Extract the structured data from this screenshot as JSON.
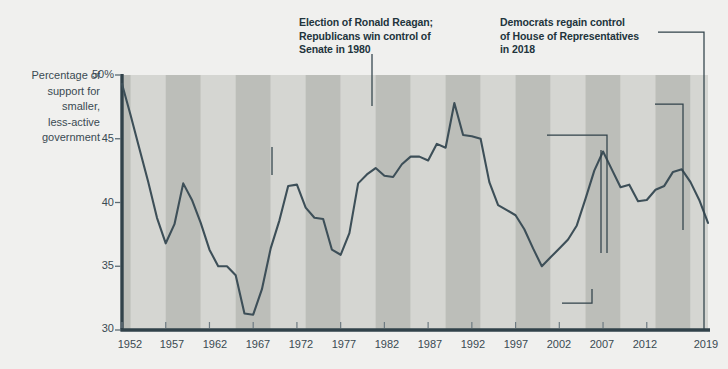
{
  "chart_data": {
    "type": "line",
    "title": "",
    "xlabel": "",
    "ylabel": "Percentage of support for smaller, less-active government",
    "ylim": [
      30,
      50
    ],
    "xlim": [
      1952,
      2019
    ],
    "grid": false,
    "legend": "none",
    "y_ticks": [
      "50%",
      "45",
      "40",
      "35",
      "30"
    ],
    "y_tick_values": [
      50,
      45,
      40,
      35,
      30
    ],
    "x_ticks": [
      "1952",
      "1957",
      "1962",
      "1967",
      "1972",
      "1977",
      "1982",
      "1987",
      "1992",
      "1997",
      "2002",
      "2007",
      "2012",
      "2019"
    ],
    "x_tick_values": [
      1952,
      1957,
      1962,
      1967,
      1972,
      1977,
      1982,
      1987,
      1992,
      1997,
      2002,
      2007,
      2012,
      2019
    ],
    "line_color": "#3d4f58",
    "band_color_light": "#d5d6d2",
    "band_color_dark": "#bcbeb9",
    "series": [
      {
        "name": "Percentage of support for smaller, less-active government",
        "x": [
          1952,
          1953,
          1954,
          1955,
          1956,
          1957,
          1958,
          1959,
          1960,
          1961,
          1962,
          1963,
          1964,
          1965,
          1966,
          1967,
          1968,
          1969,
          1970,
          1971,
          1972,
          1973,
          1974,
          1975,
          1976,
          1977,
          1978,
          1979,
          1980,
          1981,
          1982,
          1983,
          1984,
          1985,
          1986,
          1987,
          1988,
          1989,
          1990,
          1991,
          1992,
          1993,
          1994,
          1995,
          1996,
          1997,
          1998,
          1999,
          2000,
          2001,
          2002,
          2003,
          2004,
          2005,
          2006,
          2007,
          2008,
          2009,
          2010,
          2011,
          2012,
          2013,
          2014,
          2015,
          2016,
          2017,
          2018,
          2019
        ],
        "values": [
          49.3,
          46.8,
          44.2,
          41.6,
          38.8,
          36.8,
          38.3,
          41.5,
          40.2,
          38.4,
          36.3,
          35.0,
          35.0,
          34.3,
          31.3,
          31.2,
          33.2,
          36.4,
          38.6,
          41.3,
          41.4,
          39.6,
          38.8,
          38.7,
          36.3,
          35.9,
          37.6,
          41.5,
          42.2,
          42.7,
          42.1,
          42.0,
          43.0,
          43.6,
          43.6,
          43.3,
          44.6,
          44.3,
          47.8,
          45.3,
          45.2,
          45.0,
          41.6,
          39.8,
          39.4,
          39.0,
          37.9,
          36.4,
          35.0,
          35.7,
          36.4,
          37.1,
          38.2,
          40.3,
          42.5,
          44.0,
          42.6,
          41.2,
          41.4,
          40.1,
          40.2,
          41.0,
          41.3,
          42.4,
          42.6,
          41.6,
          40.2,
          38.4
        ],
        "approx_points": [
          {
            "year": 1952,
            "value": 49.3
          },
          {
            "year": 1957,
            "value": 36.8
          },
          {
            "year": 1959,
            "value": 41.5
          },
          {
            "year": 1962,
            "value": 35.0
          },
          {
            "year": 1965,
            "value": 31.3
          },
          {
            "year": 1968,
            "value": 36.4
          },
          {
            "year": 1971,
            "value": 41.4
          },
          {
            "year": 1973,
            "value": 38.8
          },
          {
            "year": 1976,
            "value": 35.9
          },
          {
            "year": 1980,
            "value": 45.7
          },
          {
            "year": 1982,
            "value": 41.8
          },
          {
            "year": 1984,
            "value": 42.0
          },
          {
            "year": 1986,
            "value": 43.3
          },
          {
            "year": 1990,
            "value": 47.8
          },
          {
            "year": 1992,
            "value": 45.1
          },
          {
            "year": 1996,
            "value": 39.0
          },
          {
            "year": 2000,
            "value": 35.0
          },
          {
            "year": 2006,
            "value": 33.4
          },
          {
            "year": 2008,
            "value": 33.5
          },
          {
            "year": 2010,
            "value": 38.6
          },
          {
            "year": 2012,
            "value": 38.0
          },
          {
            "year": 2015,
            "value": 40.3
          },
          {
            "year": 2016,
            "value": 40.1
          },
          {
            "year": 2019,
            "value": 31.3
          }
        ]
      }
    ],
    "annotations": [
      {
        "id": "great-society",
        "text": "Great Society and\nexpansion of federal\ngovernment in 1964"
      },
      {
        "id": "reagan",
        "text": "Election of Ronald Reagan;\nRepublicans win control of\nSenate in 1980"
      },
      {
        "id": "dems-house-2018",
        "text": "Democrats regain control\nof House of Representatives\nin 2018"
      },
      {
        "id": "gop-house-2010",
        "text": "Republicans win\ncontrol of House\nin 2010"
      },
      {
        "id": "trump-2016",
        "text": "Election of Donald\nTrump in 2016"
      },
      {
        "id": "obama-2008",
        "text": "Election of Barack\nObama in 2008"
      },
      {
        "id": "dems-congress-2006",
        "text": "Democrats win control\nof Congress in 2006"
      }
    ]
  },
  "axis": {
    "y_label_text": "Percentage of\nsupport for\nsmaller,\nless-active\ngovernment"
  }
}
